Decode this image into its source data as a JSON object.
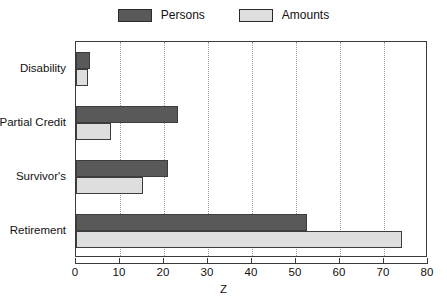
{
  "chart_data": {
    "type": "bar",
    "orientation": "horizontal",
    "title": "",
    "xlabel": "Z",
    "ylabel": "",
    "xlim": [
      0,
      80
    ],
    "xticks": [
      0,
      10,
      20,
      30,
      40,
      50,
      60,
      70,
      80
    ],
    "grid": true,
    "legend_position": "top-center",
    "categories": [
      "Disability",
      "Partial Credit",
      "Survivor's",
      "Retirement"
    ],
    "series": [
      {
        "name": "Persons",
        "color": "#595959",
        "values": [
          3.2,
          23.2,
          21.0,
          52.5
        ]
      },
      {
        "name": "Amounts",
        "color": "#dedede",
        "values": [
          2.8,
          8.0,
          15.3,
          74.2
        ]
      }
    ]
  },
  "legend": {
    "entries": [
      {
        "label": "Persons",
        "swatch": "#595959"
      },
      {
        "label": "Amounts",
        "swatch": "#dedede"
      }
    ]
  },
  "axis": {
    "x_title": "Z",
    "tick_labels": [
      "0",
      "10",
      "20",
      "30",
      "40",
      "50",
      "60",
      "70",
      "80"
    ]
  },
  "caption": ""
}
